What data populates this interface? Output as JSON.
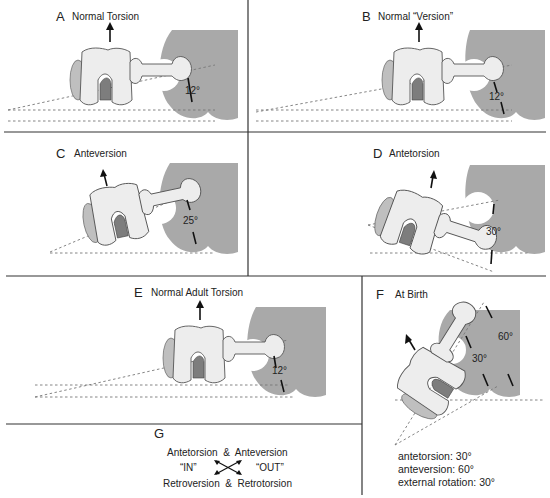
{
  "figure": {
    "panels": [
      {
        "id": "A",
        "letter": "A",
        "title": "Normal Torsion",
        "angle": "12°"
      },
      {
        "id": "B",
        "letter": "B",
        "title": "Normal “Version”",
        "angle": "12°"
      },
      {
        "id": "C",
        "letter": "C",
        "title": "Anteversion",
        "angle": "25°"
      },
      {
        "id": "D",
        "letter": "D",
        "title": "Antetorsion",
        "angle": "30°"
      },
      {
        "id": "E",
        "letter": "E",
        "title": "Normal Adult Torsion",
        "angle": "12°"
      },
      {
        "id": "F",
        "letter": "F",
        "title": "At Birth",
        "angle_inner": "30°",
        "angle_outer": "60°",
        "notes": [
          "antetorsion: 30°",
          "anteversion: 60°",
          "external rotation: 30°"
        ]
      },
      {
        "id": "G",
        "letter": "G",
        "legend": {
          "top": "Antetorsion  &  Anteversion",
          "left": "“IN”",
          "right": "“OUT”",
          "bottom": "Retroversion  &  Retrotorsion"
        }
      }
    ]
  }
}
